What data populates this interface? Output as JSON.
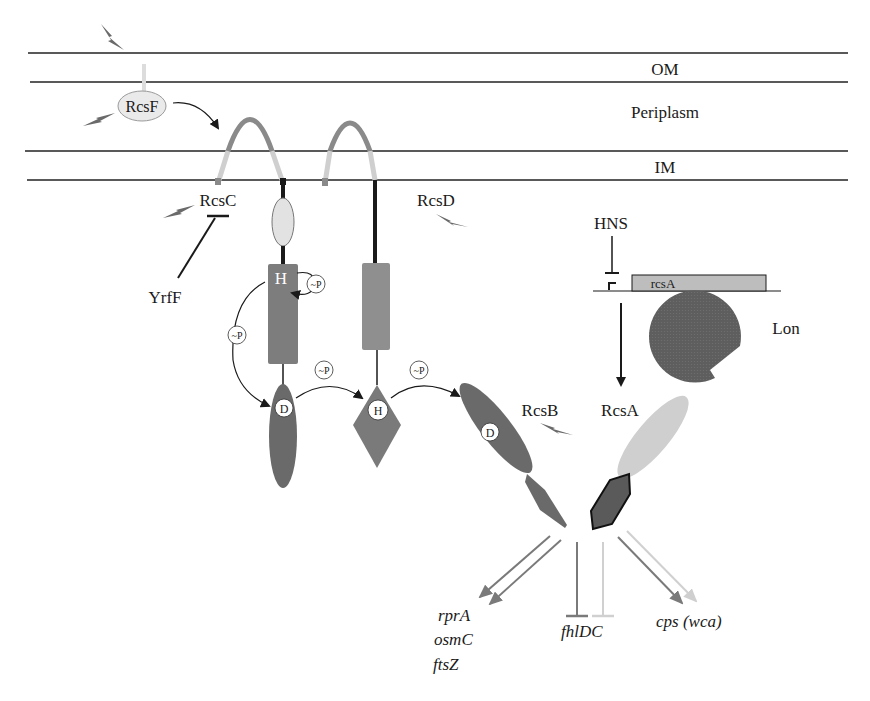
{
  "diagram": {
    "compartments": {
      "om": "OM",
      "periplasm": "Periplasm",
      "im": "IM"
    },
    "proteins": {
      "rcsf": "RcsF",
      "rcsc": "RcsC",
      "yrff": "YrfF",
      "rcsd": "RcsD",
      "rcsb": "RcsB",
      "rcsa": "RcsA",
      "hns": "HNS",
      "lon": "Lon"
    },
    "gene": {
      "rcsa_gene": "rcsA"
    },
    "domains": {
      "rcsc_his": "H",
      "rcsc_asp": "D",
      "rcsd_hpt": "H",
      "rcsb_asp": "D"
    },
    "phosphate_label": "~P",
    "targets": {
      "activated_left": [
        "rprA",
        "osmC",
        "ftsZ"
      ],
      "repressed": "fhlDC",
      "activated_right": "cps (wca)"
    },
    "colors": {
      "dark_gray": "#6e6e6e",
      "medium_gray": "#8f8f8f",
      "light_gray": "#c8c8c8",
      "pale_gray": "#e6e6e6",
      "line_black": "#1a1a1a"
    }
  }
}
